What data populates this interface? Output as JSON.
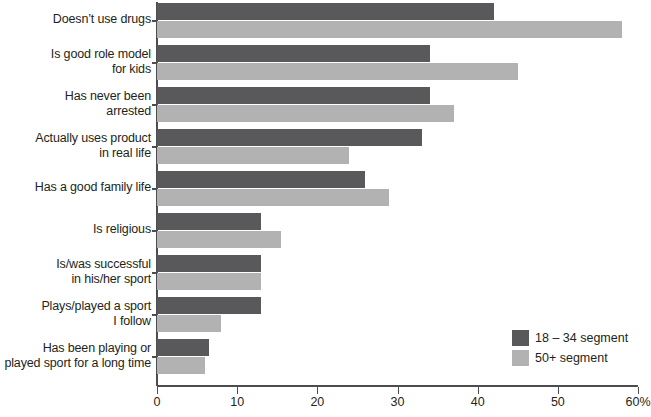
{
  "chart_data": {
    "type": "bar",
    "orientation": "horizontal",
    "title": "",
    "xlabel": "",
    "ylabel": "",
    "xlim": [
      0,
      60
    ],
    "xticks": [
      0,
      10,
      20,
      30,
      40,
      50,
      60
    ],
    "xtick_labels": [
      "0",
      "10",
      "20",
      "30",
      "40",
      "50",
      "60%"
    ],
    "grid": false,
    "legend_position": "bottom-right",
    "categories": [
      "Doesn’t use drugs",
      "Is good role model for kids",
      "Has never been arrested",
      "Actually uses product in real life",
      "Has a good family life",
      "Is religious",
      "Is/was successful in his/her sport",
      "Plays/played a sport I follow",
      "Has been playing or played sport for a long time"
    ],
    "series": [
      {
        "name": "18 – 34 segment",
        "color": "#59595b",
        "values": [
          42,
          34,
          34,
          33,
          26,
          13,
          13,
          13,
          6.5
        ]
      },
      {
        "name": "50+ segment",
        "color": "#b2b2b2",
        "values": [
          58,
          45,
          37,
          24,
          29,
          15.5,
          13,
          8,
          6
        ]
      }
    ]
  },
  "categories_display": [
    {
      "lines": [
        "Doesn’t use drugs"
      ]
    },
    {
      "lines": [
        "Is good role model",
        "for kids"
      ]
    },
    {
      "lines": [
        "Has never been",
        "arrested"
      ]
    },
    {
      "lines": [
        "Actually uses product",
        "in real life"
      ]
    },
    {
      "lines": [
        "Has a good family life"
      ]
    },
    {
      "lines": [
        "Is religious"
      ]
    },
    {
      "lines": [
        "Is/was successful",
        "in his/her sport"
      ]
    },
    {
      "lines": [
        "Plays/played a sport",
        "I follow"
      ]
    },
    {
      "lines": [
        "Has been playing or",
        "played sport for a long time"
      ]
    }
  ],
  "legend": {
    "entries": [
      {
        "label": "18 – 34 segment",
        "color": "#59595b"
      },
      {
        "label": "50+ segment",
        "color": "#b2b2b2"
      }
    ]
  },
  "axis": {
    "tick_labels": [
      "0",
      "10",
      "20",
      "30",
      "40",
      "50",
      "60%"
    ]
  }
}
